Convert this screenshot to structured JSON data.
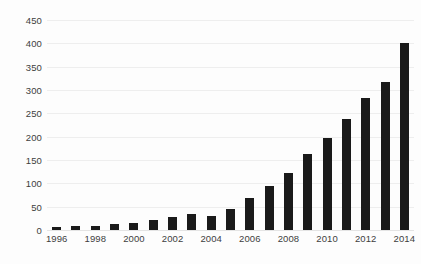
{
  "chart_data": {
    "type": "bar",
    "title": "",
    "subtitle": "",
    "xlabel": "",
    "ylabel": "",
    "categories": [
      "1996",
      "1997",
      "1998",
      "1999",
      "2000",
      "2001",
      "2002",
      "2003",
      "2004",
      "2005",
      "2006",
      "2007",
      "2008",
      "2009",
      "2010",
      "2011",
      "2012",
      "2013",
      "2014"
    ],
    "values": [
      7,
      8,
      9,
      12,
      15,
      22,
      28,
      35,
      30,
      45,
      68,
      95,
      122,
      162,
      198,
      238,
      283,
      318,
      400
    ],
    "series": [
      {
        "name": "",
        "values": [
          7,
          8,
          9,
          12,
          15,
          22,
          28,
          35,
          30,
          45,
          68,
          95,
          122,
          162,
          198,
          238,
          283,
          318,
          400
        ]
      }
    ],
    "ylim": [
      0,
      450
    ],
    "xlim_categories": [
      "1996",
      "2014"
    ],
    "y_ticks": [
      0,
      50,
      100,
      150,
      200,
      250,
      300,
      350,
      400,
      450
    ],
    "y_tick_labels": [
      "0",
      "50",
      "100",
      "150",
      "200",
      "250",
      "300",
      "350",
      "400",
      "450"
    ],
    "x_tick_labels": [
      "1996",
      "1998",
      "2000",
      "2002",
      "2004",
      "2006",
      "2008",
      "2010",
      "2012",
      "2014"
    ],
    "x_tick_categories": [
      "1996",
      "1998",
      "2000",
      "2002",
      "2004",
      "2006",
      "2008",
      "2010",
      "2012",
      "2014"
    ],
    "grid": true,
    "grid_axis": "y",
    "legend": false,
    "legend_position": "none",
    "annotations": [],
    "colors": {
      "bar": "#1a1a1a",
      "gridline": "#eeeeee",
      "baseline": "#e4e4e4",
      "background": "#fdfdfd",
      "tick_label": "#3d3d3d"
    }
  }
}
